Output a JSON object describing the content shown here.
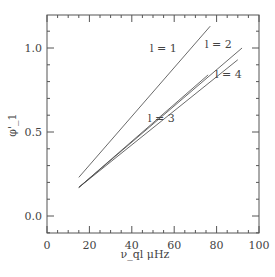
{
  "chart_data": {
    "type": "line",
    "title": "",
    "xlabel": "ν_ql μHz",
    "ylabel": "φ'_1",
    "xlim": [
      0,
      100
    ],
    "ylim": [
      -0.1,
      1.2
    ],
    "xticks": [
      "0",
      "20",
      "40",
      "60",
      "80",
      "100"
    ],
    "yticks": [
      "0.0",
      "0.5",
      "1.0"
    ],
    "series": [
      {
        "name": "l = 1",
        "x": [
          15,
          77
        ],
        "y": [
          0.23,
          1.13
        ]
      },
      {
        "name": "l = 2",
        "x": [
          15,
          92
        ],
        "y": [
          0.17,
          1.0
        ]
      },
      {
        "name": "l = 3",
        "x": [
          15,
          76
        ],
        "y": [
          0.17,
          0.84
        ]
      },
      {
        "name": "l = 4",
        "x": [
          15,
          90
        ],
        "y": [
          0.17,
          0.93
        ]
      }
    ],
    "grid": false,
    "legend": "inline labels"
  }
}
